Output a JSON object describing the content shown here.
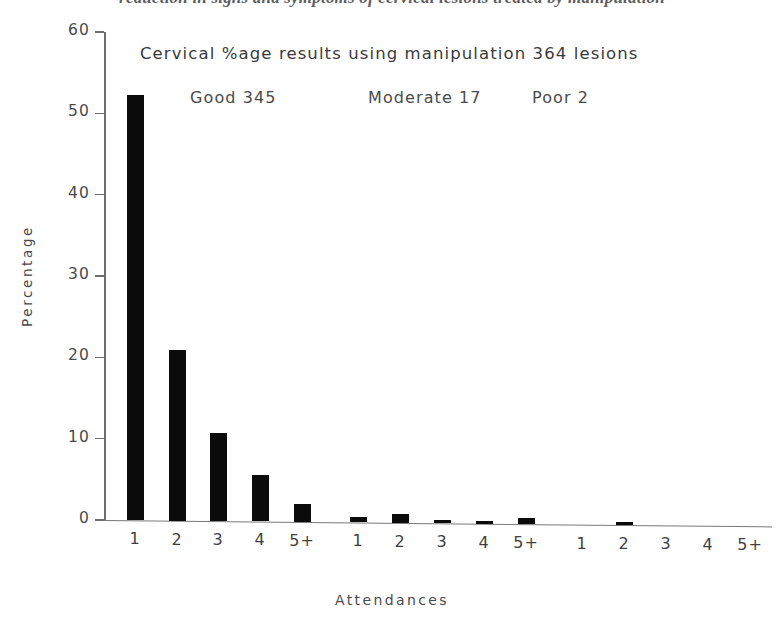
{
  "figure": {
    "caption_fragment": "reduction in signs and symptoms of cervical lesions treated by manipulation"
  },
  "annotations": {
    "heading": "Cervical  %age results using manipulation  364  lesions",
    "groups": [
      {
        "name": "Good 345",
        "id": "good"
      },
      {
        "name": "Moderate 17",
        "id": "moderate"
      },
      {
        "name": "Poor 2",
        "id": "poor"
      }
    ]
  },
  "colors": {
    "bar": "#0b0b0b",
    "axis": "#6e6e6e",
    "text": "#3f3f3f",
    "background": "#ffffff"
  },
  "chart_data": {
    "type": "bar",
    "title": "Cervical  %age results using manipulation  364  lesions",
    "subtitle": "Good 345          Moderate 17          Poor 2",
    "xlabel": "Attendances",
    "ylabel": "Percentage",
    "ylim": [
      0,
      60
    ],
    "yticks": [
      0,
      10,
      20,
      30,
      40,
      50,
      60
    ],
    "ytick_labels": [
      "0",
      "10",
      "20",
      "30",
      "40",
      "50",
      "60"
    ],
    "grid": false,
    "legend": "none",
    "categories": [
      "1",
      "2",
      "3",
      "4",
      "5+",
      "1",
      "2",
      "3",
      "4",
      "5+",
      "1",
      "2",
      "3",
      "4",
      "5+"
    ],
    "group_labels": [
      "Good 345",
      "Moderate 17",
      "Poor 2"
    ],
    "values": [
      52.3,
      21.0,
      10.8,
      5.7,
      2.2,
      0.7,
      1.1,
      0.4,
      0.3,
      0.8,
      0.0,
      0.4,
      0.0,
      0.0,
      0.0
    ],
    "bars": [
      {
        "group": "Good 345",
        "category": "1",
        "value": 52.3,
        "x": 135
      },
      {
        "group": "Good 345",
        "category": "2",
        "value": 21.0,
        "x": 177
      },
      {
        "group": "Good 345",
        "category": "3",
        "value": 10.8,
        "x": 218
      },
      {
        "group": "Good 345",
        "category": "4",
        "value": 5.7,
        "x": 260
      },
      {
        "group": "Good 345",
        "category": "5+",
        "value": 2.2,
        "x": 302
      },
      {
        "group": "Moderate 17",
        "category": "1",
        "value": 0.7,
        "x": 358
      },
      {
        "group": "Moderate 17",
        "category": "2",
        "value": 1.1,
        "x": 400
      },
      {
        "group": "Moderate 17",
        "category": "3",
        "value": 0.4,
        "x": 442
      },
      {
        "group": "Moderate 17",
        "category": "4",
        "value": 0.3,
        "x": 484
      },
      {
        "group": "Moderate 17",
        "category": "5+",
        "value": 0.8,
        "x": 526
      },
      {
        "group": "Poor 2",
        "category": "1",
        "value": 0.0,
        "x": 582
      },
      {
        "group": "Poor 2",
        "category": "2",
        "value": 0.4,
        "x": 624
      },
      {
        "group": "Poor 2",
        "category": "3",
        "value": 0.0,
        "x": 666
      },
      {
        "group": "Poor 2",
        "category": "4",
        "value": 0.0,
        "x": 708
      },
      {
        "group": "Poor 2",
        "category": "5+",
        "value": 0.0,
        "x": 750
      }
    ]
  }
}
